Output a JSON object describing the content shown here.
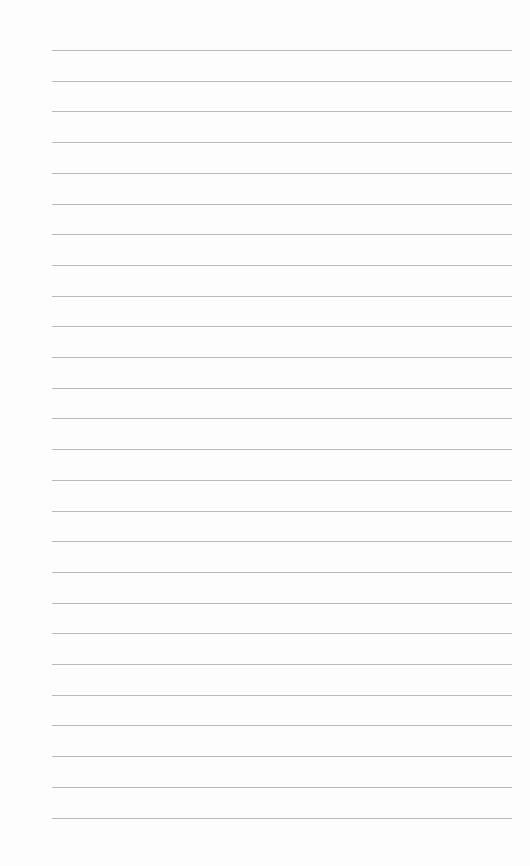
{
  "page": {
    "type": "lined-paper",
    "line_count": 26,
    "first_line_y": 50,
    "line_spacing": 30.7,
    "line_left": 52,
    "line_width": 460,
    "line_color": "#b9b9b9",
    "background_color": "#fdfdfd"
  }
}
